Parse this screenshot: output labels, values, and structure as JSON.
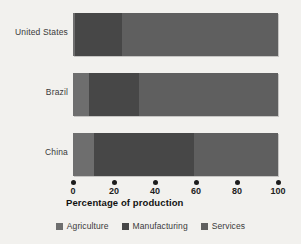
{
  "chart_data": {
    "type": "bar",
    "orientation": "horizontal",
    "stacked": true,
    "title": "",
    "xlabel": "Percentage of production",
    "ylabel": "",
    "xlim": [
      0,
      100
    ],
    "xticks": [
      0,
      20,
      40,
      60,
      80,
      100
    ],
    "xtick_labels": [
      "0",
      "20",
      "40",
      "60",
      "80",
      "100"
    ],
    "grid": false,
    "legend_position": "bottom",
    "categories": [
      "United States",
      "Brazil",
      "China"
    ],
    "series": [
      {
        "name": "Agriculture",
        "color": "#6e6e6e",
        "values": [
          1,
          8,
          10
        ]
      },
      {
        "name": "Manufacturing",
        "color": "#474747",
        "values": [
          23,
          24,
          49
        ]
      },
      {
        "name": "Services",
        "color": "#5f5f5f",
        "values": [
          76,
          68,
          41
        ]
      }
    ],
    "segment_boundaries": {
      "United States": [
        1,
        24,
        100
      ],
      "Brazil": [
        8,
        32,
        100
      ],
      "China": [
        10,
        59,
        100
      ]
    }
  },
  "axis": {
    "title": "Percentage of production",
    "ticks": [
      "0",
      "20",
      "40",
      "60",
      "80",
      "100"
    ]
  },
  "legend": {
    "items": [
      {
        "label": "Agriculture"
      },
      {
        "label": "Manufacturing"
      },
      {
        "label": "Services"
      }
    ]
  },
  "categories": [
    {
      "label": "United States"
    },
    {
      "label": "Brazil"
    },
    {
      "label": "China"
    }
  ]
}
